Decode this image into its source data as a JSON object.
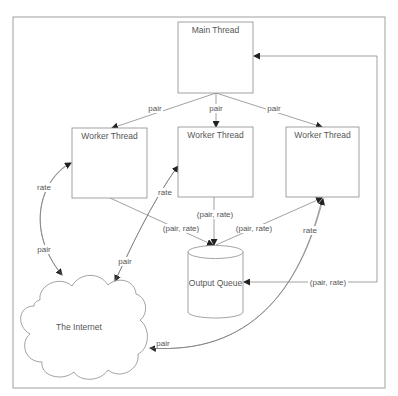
{
  "diagram": {
    "nodes": {
      "main": {
        "label": "Main Thread"
      },
      "worker1": {
        "label": "Worker Thread"
      },
      "worker2": {
        "label": "Worker Thread"
      },
      "worker3": {
        "label": "Worker Thread"
      },
      "queue": {
        "label": "Output Queue"
      },
      "internet": {
        "label": "The Internet"
      }
    },
    "edges": {
      "main_w1": {
        "label": "pair"
      },
      "main_w2": {
        "label": "pair"
      },
      "main_w3": {
        "label": "pair"
      },
      "w1_queue": {
        "label": "(pair, rate)"
      },
      "w2_queue": {
        "label": "(pair, rate)"
      },
      "w3_queue": {
        "label": "(pair, rate)"
      },
      "queue_main": {
        "label": "(pair, rate)"
      },
      "w1_internet_rate": {
        "label": "rate"
      },
      "w1_internet_pair": {
        "label": "pair"
      },
      "w2_internet_rate": {
        "label": "rate"
      },
      "w2_internet_pair": {
        "label": "pair"
      },
      "w3_internet_rate": {
        "label": "rate"
      },
      "w3_internet_pair": {
        "label": "pair"
      }
    }
  }
}
